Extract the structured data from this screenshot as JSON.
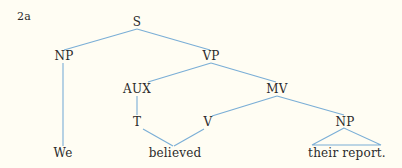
{
  "example_label": "2a",
  "edge_color": "#7aaed6",
  "background": "#fffdf3",
  "tree": {
    "nodes": {
      "S": "S",
      "NP_subj": "NP",
      "VP": "VP",
      "AUX": "AUX",
      "MV": "MV",
      "T": "T",
      "V": "V",
      "NP_obj": "NP"
    },
    "leaves": {
      "we": "We",
      "believed": "believed",
      "their_report": "their report."
    },
    "structure": [
      {
        "parent": "S",
        "children": [
          "NP",
          "VP"
        ]
      },
      {
        "parent": "NP",
        "children": [
          "We"
        ]
      },
      {
        "parent": "VP",
        "children": [
          "AUX",
          "MV"
        ]
      },
      {
        "parent": "AUX",
        "children": [
          "T"
        ]
      },
      {
        "parent": "T",
        "children": [
          "believed"
        ]
      },
      {
        "parent": "MV",
        "children": [
          "V",
          "NP"
        ]
      },
      {
        "parent": "V",
        "children": [
          "believed"
        ]
      },
      {
        "parent": "NP",
        "children": [
          "their report."
        ],
        "triangle": true
      }
    ]
  }
}
